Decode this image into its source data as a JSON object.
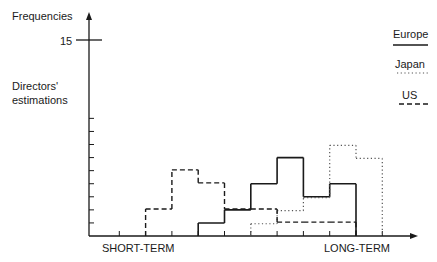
{
  "chart_data": {
    "type": "bar",
    "subtype": "step-histogram",
    "title": "",
    "ylabel": "Frequencies",
    "ylabel_secondary": "Directors' estimations",
    "xlabel_left": "SHORT-TERM",
    "xlabel_right": "LONG-TERM",
    "y_marked_tick": 15,
    "ylim": [
      0,
      15
    ],
    "y_minor_ticks": [
      1,
      2,
      3,
      4,
      5,
      6,
      7,
      8,
      9
    ],
    "grid": false,
    "legend_position": "top-right",
    "bins": [
      "1",
      "2",
      "3",
      "4",
      "5",
      "6",
      "7",
      "8",
      "9",
      "10",
      "11",
      "12"
    ],
    "series": [
      {
        "name": "Europe",
        "style": "solid",
        "values": [
          0,
          0,
          0,
          0,
          1,
          2,
          4,
          6,
          3,
          4,
          0,
          0
        ]
      },
      {
        "name": "Japan",
        "style": "dotted",
        "values": [
          0,
          0,
          0,
          0,
          0,
          0,
          1,
          2,
          3,
          7,
          6,
          0
        ]
      },
      {
        "name": "US",
        "style": "dashed",
        "values": [
          0,
          0,
          2,
          5,
          4,
          2,
          2,
          1,
          1,
          1,
          0,
          0
        ]
      }
    ]
  },
  "labels": {
    "y_axis_title": "Frequencies",
    "y_tick_15": "15",
    "y_subtitle_line1": "Directors'",
    "y_subtitle_line2": "estimations",
    "x_left": "SHORT-TERM",
    "x_right": "LONG-TERM"
  },
  "legend": [
    {
      "label": "Europe",
      "style": "solid"
    },
    {
      "label": "Japan",
      "style": "dotted"
    },
    {
      "label": "US",
      "style": "dashed"
    }
  ],
  "colors": {
    "ink": "#1a1a1a",
    "dotted": "#555555",
    "background": "#ffffff"
  }
}
